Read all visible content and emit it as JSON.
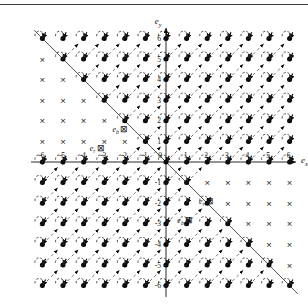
{
  "figure": {
    "type": "vector-field-lattice-diagram",
    "top_rule": true,
    "background": "#ffffff",
    "ink": "#111111"
  },
  "axes": {
    "x_axis_label": "e",
    "x_axis_sub": "x",
    "y_axis_label": "e",
    "y_axis_sub": "y",
    "x_ticks": [
      -6,
      -5,
      -4,
      -3,
      -2,
      -1,
      0,
      1,
      2,
      3,
      4,
      5,
      6
    ],
    "y_ticks": [
      -6,
      -5,
      -4,
      -3,
      -2,
      -1,
      0,
      1,
      2,
      3,
      4,
      5,
      6
    ],
    "x_tick_labels": [
      "-6",
      "-5",
      "-4",
      "-3",
      "-2",
      "-1",
      "0",
      "1",
      "2",
      "3",
      "4",
      "5",
      "6"
    ],
    "y_tick_labels": [
      "-6",
      "-5",
      "-4",
      "-3",
      "-2",
      "-1",
      "0",
      "1",
      "2",
      "3",
      "4",
      "5",
      "6"
    ],
    "origin_label": "0",
    "xlim": [
      -6.6,
      6.6
    ],
    "ylim": [
      -6.6,
      6.6
    ],
    "grid": false,
    "arrowheads": true
  },
  "inline_labels": [
    {
      "name": "e-b-upper",
      "base": "e",
      "sub": "b",
      "boxed_glyph": "⊠",
      "x": -2.6,
      "y": 1.45
    },
    {
      "name": "e-r-upper",
      "base": "e",
      "sub": "r",
      "boxed_glyph": "⊠",
      "x": -3.7,
      "y": 0.55
    },
    {
      "name": "e-r-lower",
      "base": "e",
      "sub": "r",
      "boxed_glyph": "⊠",
      "x": 1.6,
      "y": -2.05
    },
    {
      "name": "e-b-lower",
      "base": "e",
      "sub": "b",
      "boxed_glyph": "⊠",
      "x": 0.55,
      "y": -2.95
    }
  ],
  "guide_lines": {
    "solid_antidiagonal": {
      "from": [
        -6.4,
        6.4
      ],
      "to": [
        6.4,
        -6.4
      ],
      "style": "solid",
      "color": "#444444"
    },
    "dashed_diagonals_note": "dashed 45-degree segments link neighbouring lattice sites",
    "dash_pattern": "3 3"
  },
  "markers": {
    "cross": {
      "glyph": "×",
      "meaning": "vacant-site-cross",
      "color": "#222222"
    },
    "dot": {
      "glyph": "●",
      "meaning": "occupied-site-dot",
      "color": "#000000"
    },
    "arrow": {
      "meaning": "spin-arrow",
      "color": "#000000"
    },
    "arc": {
      "meaning": "rotation-arc",
      "color": "#333333"
    }
  },
  "chart_data": {
    "type": "scatter",
    "title": "",
    "xlabel": "e_x",
    "ylabel": "e_y",
    "xlim": [
      -6.6,
      6.6
    ],
    "ylim": [
      -6.6,
      6.6
    ],
    "lattice_spacing": 1,
    "legend": [],
    "regions": [
      {
        "name": "upper-left-cross-region",
        "marker": "cross",
        "rule": "x + y < 0 and x < 0 and y > 0"
      },
      {
        "name": "lower-right-cross-region",
        "marker": "cross",
        "rule": "x + y > 0 and x > 0 and y < 0"
      },
      {
        "name": "dot-arrow-region",
        "marker": "dot-with-arrow-and-arc",
        "rule": "all remaining lattice sites"
      }
    ]
  }
}
